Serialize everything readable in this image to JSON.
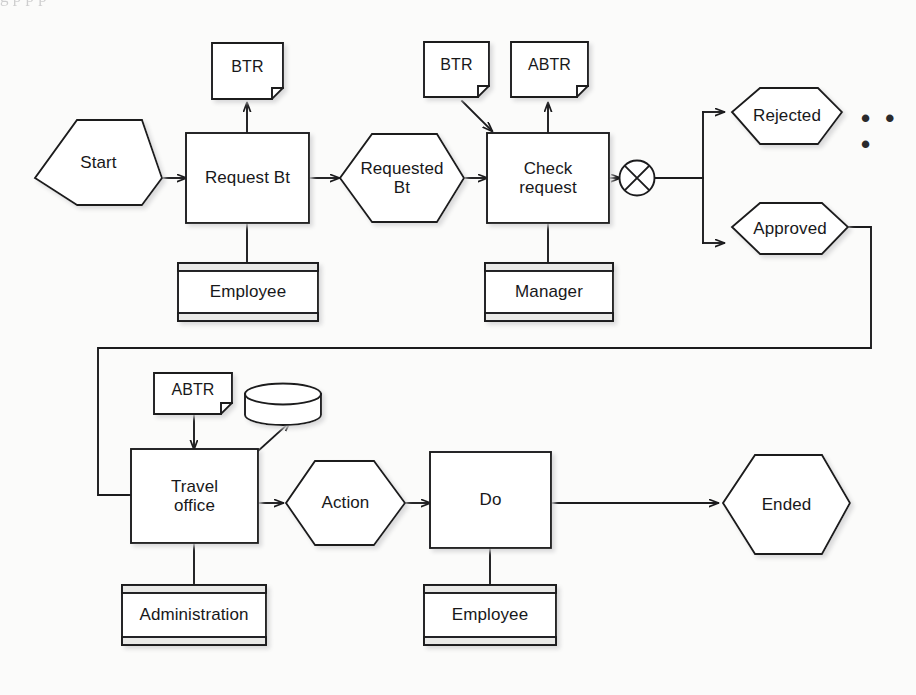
{
  "diagram": {
    "notation": "event-driven process chain",
    "page_top_fragment": "g                                                                                          p  p            p",
    "colors": {
      "stroke": "#1b1b1d",
      "text": "#18181a",
      "background": "#fbfbfa",
      "shadow": "#b9b9b9",
      "resource_band": "#e9e9e7"
    },
    "events": [
      {
        "id": "start",
        "label": "Start"
      },
      {
        "id": "requested",
        "label": "Requested\nBt"
      },
      {
        "id": "rejected",
        "label": "Rejected"
      },
      {
        "id": "approved",
        "label": "Approved"
      },
      {
        "id": "action",
        "label": "Action"
      },
      {
        "id": "ended",
        "label": "Ended"
      }
    ],
    "functions": [
      {
        "id": "request-bt",
        "label": "Request  Bt"
      },
      {
        "id": "check-request",
        "label": "Check\nrequest"
      },
      {
        "id": "travel-office",
        "label": "Travel\noffice"
      },
      {
        "id": "do",
        "label": "Do"
      }
    ],
    "documents": [
      {
        "id": "btr-top",
        "label": "BTR"
      },
      {
        "id": "btr-mid",
        "label": "BTR"
      },
      {
        "id": "abtr-top",
        "label": "ABTR"
      },
      {
        "id": "abtr-lower",
        "label": "ABTR"
      }
    ],
    "resources": [
      {
        "id": "employee-1",
        "label": "Employee"
      },
      {
        "id": "manager",
        "label": "Manager"
      },
      {
        "id": "administration",
        "label": "Administration"
      },
      {
        "id": "employee-2",
        "label": "Employee"
      }
    ],
    "data_stores": [
      {
        "id": "database",
        "label": ""
      }
    ],
    "gateways": [
      {
        "id": "xor-split",
        "label": "",
        "symbol": "X"
      }
    ],
    "continuation_marker": "• • •"
  }
}
